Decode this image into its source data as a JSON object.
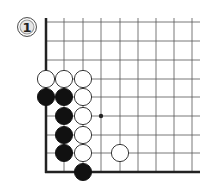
{
  "diagram": {
    "number_label": "1",
    "colors": {
      "line": "#555555",
      "edge": "#222222",
      "black_stone": "#111111",
      "white_stone": "#ffffff",
      "white_outline": "#222222"
    },
    "grid": {
      "x": [
        46,
        64,
        83,
        101,
        120,
        138,
        156,
        174,
        192
      ],
      "y": [
        22,
        41,
        60,
        79,
        97,
        116,
        135,
        153,
        172
      ],
      "right_end": 200,
      "top_start": 18,
      "edges": [
        "left",
        "bottom"
      ]
    },
    "stones": [
      {
        "color": "white",
        "col": 0,
        "row": 3
      },
      {
        "color": "white",
        "col": 1,
        "row": 3
      },
      {
        "color": "white",
        "col": 2,
        "row": 3
      },
      {
        "color": "black",
        "col": 0,
        "row": 4
      },
      {
        "color": "black",
        "col": 1,
        "row": 4
      },
      {
        "color": "white",
        "col": 2,
        "row": 4
      },
      {
        "color": "black",
        "col": 1,
        "row": 5
      },
      {
        "color": "white",
        "col": 2,
        "row": 5
      },
      {
        "color": "black",
        "col": 1,
        "row": 6
      },
      {
        "color": "white",
        "col": 2,
        "row": 6
      },
      {
        "color": "black",
        "col": 1,
        "row": 7
      },
      {
        "color": "white",
        "col": 2,
        "row": 7
      },
      {
        "color": "white",
        "col": 4,
        "row": 7
      },
      {
        "color": "black",
        "col": 2,
        "row": 8
      }
    ],
    "star_points": [
      {
        "col": 3,
        "row": 5
      }
    ]
  }
}
